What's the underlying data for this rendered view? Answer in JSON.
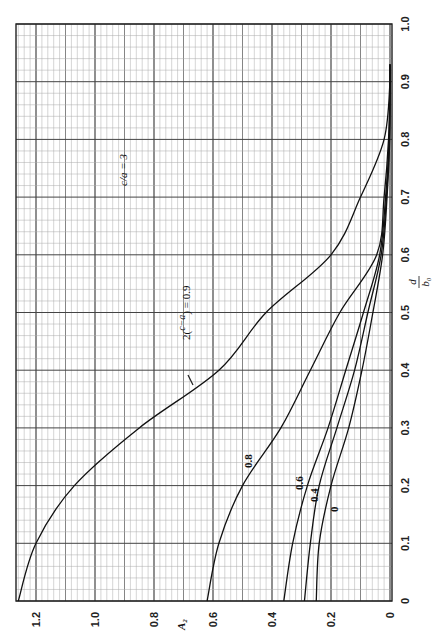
{
  "chart_data": {
    "type": "line",
    "title": "",
    "orientation": "rotated 90° counter-clockwise (x-axis d/b0 drawn vertically on right, A2 drawn horizontally along bottom)",
    "xlabel": "d/b₀",
    "ylabel": "A₂",
    "xlim": [
      0,
      1.0
    ],
    "ylim": [
      0,
      1.27
    ],
    "grid": true,
    "x_ticks": [
      "0",
      "0.1",
      "0.2",
      "0.3",
      "0.4",
      "0.5",
      "0.6",
      "0.7",
      "0.8",
      "0.9",
      "1.0"
    ],
    "y_ticks": [
      "0",
      "0.2",
      "0.4",
      "0.6",
      "0.8",
      "1.0",
      "1.2"
    ],
    "x": [
      0,
      0.1,
      0.2,
      0.3,
      0.4,
      0.5,
      0.6,
      0.7,
      0.8,
      0.9
    ],
    "series": [
      {
        "name": "2((c−a)/λ) = 0.9",
        "label": "2((c−a)/λ) = 0.9",
        "values": [
          1.26,
          1.2,
          1.07,
          0.85,
          0.58,
          0.42,
          0.2,
          0.1,
          0.02,
          0.0
        ]
      },
      {
        "name": "0.8",
        "label": "0.8",
        "values": [
          0.62,
          0.58,
          0.5,
          0.37,
          0.27,
          0.17,
          0.045,
          0.02,
          0.005,
          0.0
        ]
      },
      {
        "name": "0.6",
        "label": "0.6",
        "values": [
          0.36,
          0.33,
          0.28,
          0.21,
          0.15,
          0.09,
          0.035,
          0.015,
          0.003,
          0.0
        ]
      },
      {
        "name": "0.4",
        "label": "0.4",
        "values": [
          0.29,
          0.27,
          0.24,
          0.18,
          0.12,
          0.075,
          0.03,
          0.012,
          0.002,
          0.0
        ]
      },
      {
        "name": "0",
        "label": "0",
        "values": [
          0.25,
          0.24,
          0.2,
          0.14,
          0.095,
          0.058,
          0.025,
          0.01,
          0.001,
          0.0
        ]
      }
    ],
    "annotations": [
      "c/a = 3"
    ],
    "legend": "none (curves labeled inline)"
  },
  "labels": {
    "param_note": "c/a = 3",
    "curve_09_prefix": "2(",
    "curve_09_frac_top": "c−a",
    "curve_09_frac_bottom": "λ",
    "curve_09_suffix": ") = 0.9",
    "curve_08": "0.8",
    "curve_06": "0.6",
    "curve_04": "0.4",
    "curve_0": "0",
    "xaxis_num": "d",
    "xaxis_den": "b₀",
    "yaxis": "A₂"
  }
}
